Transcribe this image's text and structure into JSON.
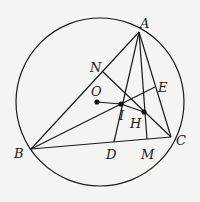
{
  "diagram": {
    "points": {
      "A": {
        "label": "A"
      },
      "B": {
        "label": "B"
      },
      "C": {
        "label": "C"
      },
      "N": {
        "label": "N"
      },
      "E": {
        "label": "E"
      },
      "O": {
        "label": "O"
      },
      "I": {
        "label": "I"
      },
      "H": {
        "label": "H"
      },
      "D": {
        "label": "D"
      },
      "M": {
        "label": "M"
      }
    },
    "segments": [
      "AB",
      "AC",
      "BC",
      "AD",
      "AM",
      "BE",
      "CN",
      "OI",
      "IH"
    ],
    "marked_points": [
      "O",
      "I",
      "H"
    ],
    "stroke_color": "#1a1a1a",
    "background_color": "#f4f4f2"
  }
}
